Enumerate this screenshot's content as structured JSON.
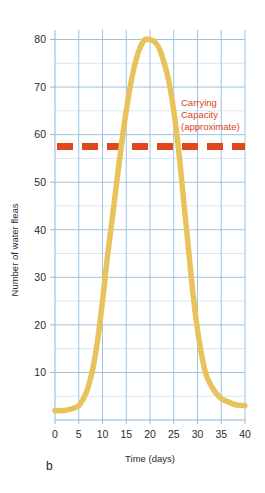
{
  "panel": {
    "label": "b"
  },
  "colors": {
    "curve": "#e8c35c",
    "carrying_capacity": "#e1471d",
    "grid_major": "#9dc3e0",
    "grid_minor": "#d7e7f3",
    "axis": "#8fb8d6",
    "text": "#2b2b2b",
    "background": "#ffffff"
  },
  "chart_data": {
    "type": "line",
    "title": "",
    "xlabel": "Time (days)",
    "ylabel": "Number of water fleas",
    "xlim": [
      0,
      40
    ],
    "ylim": [
      0,
      82
    ],
    "xticks": [
      0,
      5,
      10,
      15,
      20,
      25,
      30,
      35,
      40
    ],
    "xtick_labels": [
      "0",
      "5",
      "10",
      "15",
      "20",
      "25",
      "30",
      "35",
      "40"
    ],
    "yticks": [
      10,
      20,
      30,
      40,
      50,
      60,
      70,
      80
    ],
    "ytick_labels": [
      "10",
      "20",
      "30",
      "40",
      "50",
      "60",
      "70",
      "80"
    ],
    "grid": true,
    "grid_major_step_x": 5,
    "grid_major_step_y": 10,
    "grid_minor_step_y": 5,
    "legend": "none",
    "series": [
      {
        "name": "Water flea population",
        "color": "#e8c35c",
        "style": "solid",
        "x": [
          0,
          2,
          4,
          5,
          6,
          7,
          8,
          9,
          10,
          11,
          12,
          13,
          14,
          15,
          16,
          17,
          18,
          19,
          20,
          21,
          22,
          23,
          24,
          25,
          26,
          27,
          28,
          29,
          30,
          31,
          32,
          33,
          34,
          35,
          36,
          38,
          40
        ],
        "y": [
          2,
          2,
          2.5,
          3,
          4.5,
          7,
          11,
          17,
          25,
          34,
          42,
          50,
          58,
          65,
          71,
          75.5,
          78.5,
          80,
          80,
          79.5,
          78,
          75,
          71,
          65,
          57,
          47,
          37,
          27,
          19,
          13,
          9,
          7,
          5.5,
          4.5,
          4,
          3.2,
          3
        ]
      }
    ],
    "annotations": [
      {
        "name": "carrying-capacity",
        "type": "hline",
        "value": 57.5,
        "style": "dashed",
        "color": "#e1471d",
        "label_lines": [
          "Carrying",
          "Capacity",
          "(approximate)"
        ]
      }
    ]
  }
}
